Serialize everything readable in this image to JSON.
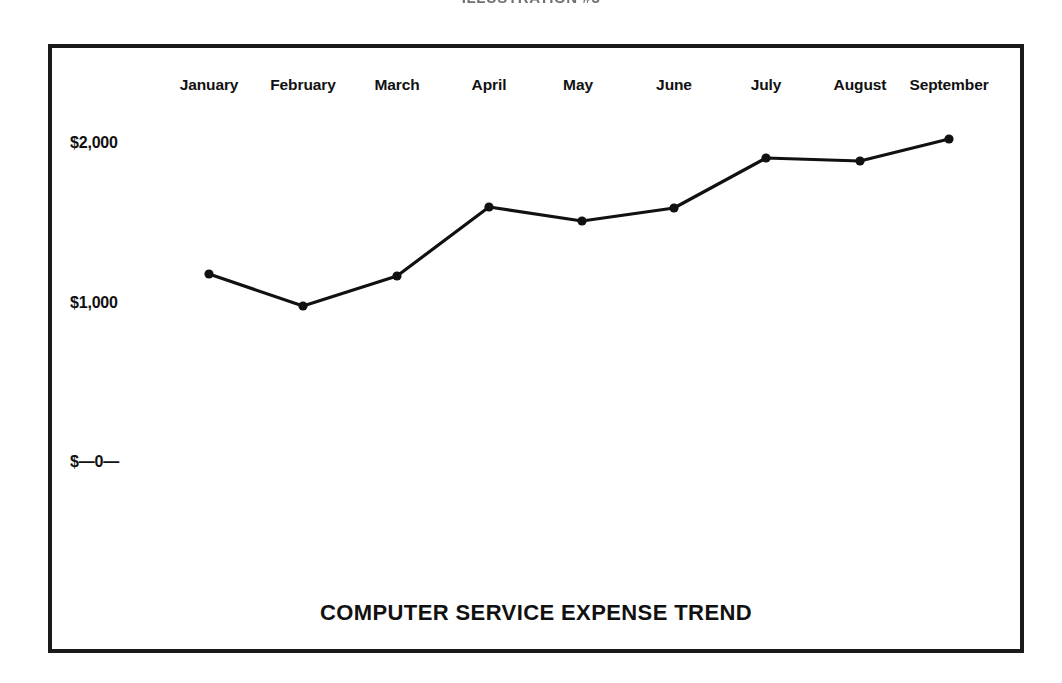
{
  "scan": {
    "top_caption_partial": "ILLUSTRATION #3"
  },
  "chart_data": {
    "type": "line",
    "title": "COMPUTER SERVICE EXPENSE TREND",
    "xlabel": "",
    "ylabel": "",
    "categories": [
      "January",
      "February",
      "March",
      "April",
      "May",
      "June",
      "July",
      "August",
      "September"
    ],
    "values": [
      1175,
      975,
      1165,
      1595,
      1510,
      1590,
      1900,
      1880,
      2020
    ],
    "series": [
      {
        "name": "Computer Service Expense",
        "values": [
          1175,
          975,
          1165,
          1595,
          1510,
          1590,
          1900,
          1880,
          2020
        ]
      }
    ],
    "ytick_labels": [
      "$2,000",
      "$1,000",
      "$—0—"
    ],
    "ytick_values": [
      2000,
      1000,
      0
    ],
    "ylim": [
      0,
      2200
    ],
    "grid": false,
    "legend": false,
    "legend_position": "none",
    "xtick_position": "top",
    "title_position": "bottom",
    "marker": "filled-circle",
    "line_color": "#111111",
    "marker_color": "#111111",
    "background_color": "#ffffff",
    "frame_color": "#1a1a1a"
  },
  "axis": {
    "y_labels": [
      {
        "text": "$2,000",
        "value": 2000
      },
      {
        "text": "$1,000",
        "value": 1000
      },
      {
        "text": "$—0—",
        "value": 0
      }
    ]
  },
  "points": [
    {
      "label": "January",
      "value": 1175,
      "x": 209,
      "y": 274
    },
    {
      "label": "February",
      "value": 975,
      "x": 303,
      "y": 306
    },
    {
      "label": "March",
      "value": 1165,
      "x": 397,
      "y": 276
    },
    {
      "label": "April",
      "value": 1595,
      "x": 489,
      "y": 207
    },
    {
      "label": "May",
      "value": 1510,
      "x": 582,
      "y": 221
    },
    {
      "label": "June",
      "value": 1590,
      "x": 674,
      "y": 208
    },
    {
      "label": "July",
      "value": 1900,
      "x": 766,
      "y": 158
    },
    {
      "label": "August",
      "value": 1880,
      "x": 860,
      "y": 161
    },
    {
      "label": "September",
      "value": 2020,
      "x": 949,
      "y": 139
    }
  ],
  "month_label_positions": [
    {
      "text": "January",
      "x": 209,
      "y": 76
    },
    {
      "text": "February",
      "x": 303,
      "y": 76
    },
    {
      "text": "March",
      "x": 397,
      "y": 76
    },
    {
      "text": "April",
      "x": 489,
      "y": 76
    },
    {
      "text": "May",
      "x": 578,
      "y": 76
    },
    {
      "text": "June",
      "x": 674,
      "y": 76
    },
    {
      "text": "July",
      "x": 766,
      "y": 76
    },
    {
      "text": "August",
      "x": 860,
      "y": 76
    },
    {
      "text": "September",
      "x": 949,
      "y": 76
    }
  ],
  "y_label_positions": [
    {
      "text": "$2,000",
      "x": 70,
      "y": 143
    },
    {
      "text": "$1,000",
      "x": 70,
      "y": 303
    },
    {
      "text": "$—0—",
      "x": 70,
      "y": 462
    }
  ]
}
